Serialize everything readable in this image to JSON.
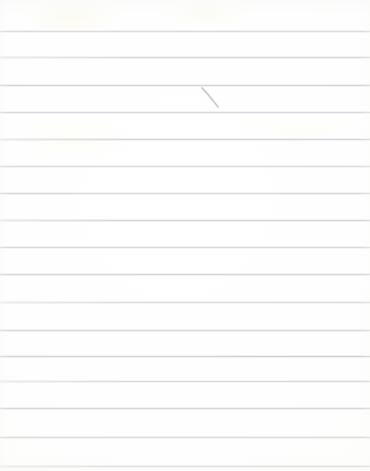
{
  "document": {
    "kind": "scanned-lined-paper",
    "description": "Blank scanned sheet of ruled notebook paper with one small pen stroke",
    "width_px": 370,
    "height_px": 471,
    "background_color": "#fefefd",
    "text_content": "",
    "has_text": false
  },
  "paper": {
    "rule_color": "#d2d4d8",
    "rule_count": 17,
    "rule_spacing_px": 27,
    "first_rule_y": 31,
    "rules": [
      {
        "y": 31,
        "fringe": "none"
      },
      {
        "y": 57,
        "fringe": "none"
      },
      {
        "y": 85,
        "fringe": "none"
      },
      {
        "y": 112,
        "fringe": "none"
      },
      {
        "y": 139,
        "fringe": "warm"
      },
      {
        "y": 166,
        "fringe": "none"
      },
      {
        "y": 193,
        "fringe": "none"
      },
      {
        "y": 220,
        "fringe": "none"
      },
      {
        "y": 247,
        "fringe": "none"
      },
      {
        "y": 274,
        "fringe": "none"
      },
      {
        "y": 302,
        "fringe": "none"
      },
      {
        "y": 330,
        "fringe": "none"
      },
      {
        "y": 356,
        "fringe": "warm"
      },
      {
        "y": 381,
        "fringe": "none"
      },
      {
        "y": 408,
        "fringe": "none"
      },
      {
        "y": 437,
        "fringe": "none"
      },
      {
        "y": 466,
        "fringe": "cool"
      }
    ]
  },
  "annotations": {
    "pen_stroke": {
      "label": "pen-stroke",
      "color": "#b9bcc6",
      "start_x": 202,
      "start_y": 88,
      "end_x": 218,
      "end_y": 107,
      "stroke_width": 1.2
    }
  }
}
